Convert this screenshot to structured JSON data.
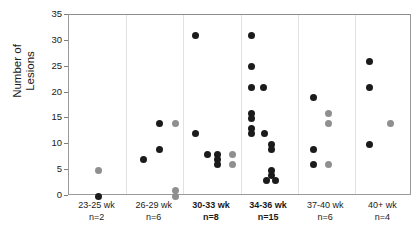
{
  "chart_data": {
    "type": "scatter",
    "title": "",
    "xlabel": "",
    "ylabel": "Number of\nLesions",
    "ylim": [
      0,
      35
    ],
    "yticks": [
      0,
      5,
      10,
      15,
      20,
      25,
      30,
      35
    ],
    "grid": false,
    "legend": "none",
    "categories": [
      "23-25 wk",
      "26-29 wk",
      "30-33 wk",
      "34-36 wk",
      "37-40 wk",
      "40+ wk"
    ],
    "group_counts": [
      "n=2",
      "n=6",
      "n=8",
      "n=15",
      "n=6",
      "n=4"
    ],
    "bold_categories": [
      "30-33 wk",
      "34-36 wk"
    ],
    "series": [
      {
        "name": "dark",
        "color": "#1b1b1b",
        "points": [
          {
            "group": 0,
            "jitter": 0.52,
            "value": 0
          },
          {
            "group": 1,
            "jitter": 0.3,
            "value": 7
          },
          {
            "group": 1,
            "jitter": 0.58,
            "value": 14
          },
          {
            "group": 1,
            "jitter": 0.58,
            "value": 9
          },
          {
            "group": 2,
            "jitter": 0.22,
            "value": 31
          },
          {
            "group": 2,
            "jitter": 0.22,
            "value": 12
          },
          {
            "group": 2,
            "jitter": 0.42,
            "value": 8
          },
          {
            "group": 2,
            "jitter": 0.6,
            "value": 8
          },
          {
            "group": 2,
            "jitter": 0.6,
            "value": 7
          },
          {
            "group": 2,
            "jitter": 0.6,
            "value": 6
          },
          {
            "group": 3,
            "jitter": 0.2,
            "value": 31
          },
          {
            "group": 3,
            "jitter": 0.2,
            "value": 25
          },
          {
            "group": 3,
            "jitter": 0.2,
            "value": 21
          },
          {
            "group": 3,
            "jitter": 0.4,
            "value": 21
          },
          {
            "group": 3,
            "jitter": 0.2,
            "value": 16
          },
          {
            "group": 3,
            "jitter": 0.2,
            "value": 15
          },
          {
            "group": 3,
            "jitter": 0.2,
            "value": 13
          },
          {
            "group": 3,
            "jitter": 0.2,
            "value": 12
          },
          {
            "group": 3,
            "jitter": 0.42,
            "value": 12
          },
          {
            "group": 3,
            "jitter": 0.54,
            "value": 10
          },
          {
            "group": 3,
            "jitter": 0.54,
            "value": 9
          },
          {
            "group": 3,
            "jitter": 0.54,
            "value": 5
          },
          {
            "group": 3,
            "jitter": 0.54,
            "value": 4
          },
          {
            "group": 3,
            "jitter": 0.46,
            "value": 3
          },
          {
            "group": 3,
            "jitter": 0.62,
            "value": 3
          },
          {
            "group": 4,
            "jitter": 0.28,
            "value": 19
          },
          {
            "group": 4,
            "jitter": 0.28,
            "value": 9
          },
          {
            "group": 4,
            "jitter": 0.28,
            "value": 6
          },
          {
            "group": 5,
            "jitter": 0.26,
            "value": 26
          },
          {
            "group": 5,
            "jitter": 0.26,
            "value": 21
          },
          {
            "group": 5,
            "jitter": 0.26,
            "value": 10
          }
        ]
      },
      {
        "name": "gray",
        "color": "#8f8f8f",
        "points": [
          {
            "group": 0,
            "jitter": 0.52,
            "value": 5
          },
          {
            "group": 1,
            "jitter": 0.86,
            "value": 14
          },
          {
            "group": 1,
            "jitter": 0.86,
            "value": 1
          },
          {
            "group": 1,
            "jitter": 0.86,
            "value": 0
          },
          {
            "group": 2,
            "jitter": 0.86,
            "value": 8
          },
          {
            "group": 2,
            "jitter": 0.86,
            "value": 6
          },
          {
            "group": 4,
            "jitter": 0.54,
            "value": 16
          },
          {
            "group": 4,
            "jitter": 0.54,
            "value": 14
          },
          {
            "group": 4,
            "jitter": 0.54,
            "value": 6
          },
          {
            "group": 5,
            "jitter": 0.62,
            "value": 14
          }
        ]
      }
    ]
  }
}
